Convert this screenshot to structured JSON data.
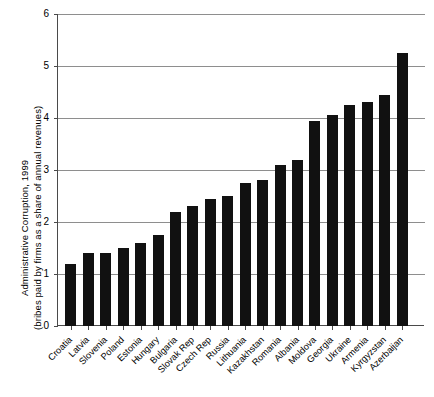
{
  "chart_data": {
    "type": "bar",
    "title": "",
    "ylabel_line1": "Administrative Corruption, 1999",
    "ylabel_line2": "(bribes paid by firms as a share of annual revenues)",
    "xlabel": "",
    "ylim": [
      0,
      6
    ],
    "yticks": [
      "0",
      "1",
      "2",
      "3",
      "4",
      "5",
      "6"
    ],
    "ytick_values": [
      0,
      1,
      2,
      3,
      4,
      5,
      6
    ],
    "grid": "horizontal",
    "legend": "none",
    "bar_color": "#111111",
    "categories": [
      "Croatia",
      "Latvia",
      "Slovenia",
      "Poland",
      "Estonia",
      "Hungary",
      "Bulgaria",
      "Slovak Rep",
      "Czech Rep",
      "Russia",
      "Lithuania",
      "Kazakhstan",
      "Romania",
      "Albania",
      "Moldova",
      "Georgia",
      "Ukraine",
      "Armenia",
      "Kyrgyzstan",
      "Azerbaijan"
    ],
    "values": [
      1.2,
      1.4,
      1.4,
      1.5,
      1.6,
      1.75,
      2.2,
      2.3,
      2.45,
      2.5,
      2.75,
      2.8,
      3.1,
      3.2,
      3.95,
      4.05,
      4.25,
      4.3,
      4.45,
      5.25
    ]
  }
}
